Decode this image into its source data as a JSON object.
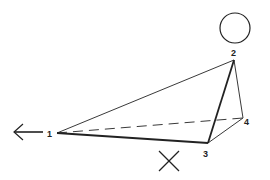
{
  "diagram": {
    "type": "pyramid-perspective",
    "labels": {
      "p1": "1",
      "p2": "2",
      "p3": "3",
      "p4": "4"
    },
    "points": {
      "p1": [
        57,
        133
      ],
      "p2": [
        234,
        60
      ],
      "p3": [
        208,
        143
      ],
      "p4": [
        243,
        118
      ]
    },
    "edges": [
      {
        "from": "p1",
        "to": "p2",
        "style": "thin"
      },
      {
        "from": "p1",
        "to": "p3",
        "style": "thick"
      },
      {
        "from": "p2",
        "to": "p3",
        "style": "thick"
      },
      {
        "from": "p2",
        "to": "p4",
        "style": "thin"
      },
      {
        "from": "p3",
        "to": "p4",
        "style": "thin"
      },
      {
        "from": "p1",
        "to": "p4",
        "style": "dashed"
      }
    ],
    "symbols": {
      "circle": {
        "cx": 235,
        "cy": 28,
        "r": 15
      },
      "cross": {
        "cx": 169,
        "cy": 161,
        "size": 20
      },
      "arrow": {
        "x1": 43,
        "y1": 132,
        "x2": 13,
        "y2": 132,
        "direction": "left"
      }
    },
    "colors": {
      "stroke": "#222222",
      "background": "#ffffff"
    }
  }
}
